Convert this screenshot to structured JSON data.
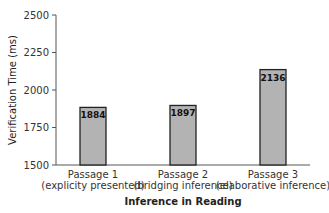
{
  "chart_data": {
    "type": "bar",
    "title": "",
    "xlabel": "Inference in Reading",
    "ylabel": "Verification Time (ms)",
    "ylim": [
      1500,
      2500
    ],
    "yticks": [
      1500,
      1750,
      2000,
      2250,
      2500
    ],
    "grid": false,
    "legend": null,
    "categories": [
      {
        "line1": "Passage 1",
        "line2": "(explicity presented)"
      },
      {
        "line1": "Passage 2",
        "line2": "(bridging inference)"
      },
      {
        "line1": "Passage 3",
        "line2": "(elaborative inference)"
      }
    ],
    "values": [
      1884,
      1897,
      2136
    ],
    "value_labels": [
      "1884",
      "1897",
      "2136"
    ],
    "bar_color": "#b3b3b3",
    "bar_edge_color": "#222222"
  }
}
